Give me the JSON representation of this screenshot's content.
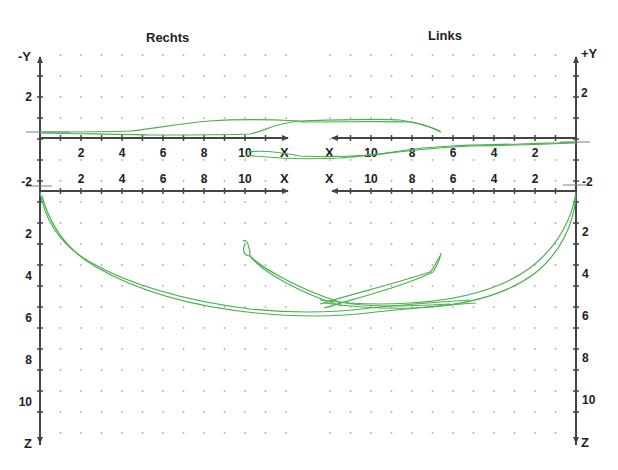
{
  "titles": {
    "left": "Rechts",
    "right": "Links"
  },
  "colors": {
    "trace": "#4caf50",
    "trace_dark": "#2e7d32",
    "axis": "#444444",
    "grid_dot": "#b0b0b0",
    "background": "#ffffff"
  },
  "axes": {
    "left_vertical_top": "-Y",
    "right_vertical_top": "+Y",
    "vertical_bottom": "Z",
    "x_label": "X"
  },
  "chart_data": {
    "type": "line",
    "panels": [
      {
        "name": "Rechts (top, X–Y plane)",
        "xlabel": "X",
        "ylabel": "-Y",
        "x_ticks": [
          2,
          4,
          6,
          8,
          10
        ],
        "y_ticks": [
          2,
          -2
        ],
        "xlim": [
          0,
          12
        ],
        "ylim": [
          -2,
          4
        ],
        "series": [
          {
            "name": "upper path",
            "x": [
              0,
              2,
              4,
              6,
              8,
              10,
              11.5
            ],
            "y": [
              0.1,
              0.1,
              0.15,
              0.6,
              0.9,
              0.95,
              0.9
            ]
          },
          {
            "name": "lower path",
            "x": [
              0,
              2,
              4,
              6,
              8,
              10,
              11.5
            ],
            "y": [
              0.1,
              0.05,
              0.0,
              -0.1,
              -0.1,
              0.0,
              0.8
            ]
          }
        ]
      },
      {
        "name": "Links (top, X–Y plane)",
        "xlabel": "X",
        "ylabel": "+Y",
        "x_ticks": [
          10,
          8,
          6,
          4,
          2
        ],
        "y_ticks": [
          2,
          -2
        ],
        "xlim": [
          12,
          0
        ],
        "ylim": [
          -2,
          4
        ],
        "series": [
          {
            "name": "upper path",
            "x": [
              12,
              10,
              8,
              6.5,
              5.5
            ],
            "y": [
              0.9,
              0.95,
              0.9,
              0.5,
              0.05
            ]
          },
          {
            "name": "lower path",
            "x": [
              12,
              10,
              8,
              6,
              4,
              2,
              0
            ],
            "y": [
              -0.7,
              -0.8,
              -0.6,
              -0.4,
              -0.4,
              -0.3,
              -0.1
            ]
          }
        ]
      },
      {
        "name": "Rechts (front, X–Z plane)",
        "xlabel": "X",
        "ylabel": "Z",
        "x_ticks": [
          2,
          4,
          6,
          8,
          10
        ],
        "z_ticks": [
          2,
          4,
          6,
          8,
          10
        ],
        "xlim": [
          0,
          12
        ],
        "zlim": [
          0,
          12
        ],
        "series": [
          {
            "name": "descent arc",
            "x": [
              0,
              1,
              2,
              4,
              6,
              8,
              10,
              12,
              14,
              16,
              18
            ],
            "z": [
              0,
              2.5,
              3.8,
              4.8,
              5.4,
              5.8,
              5.9,
              5.7,
              5.4,
              5.2,
              5.3
            ]
          },
          {
            "name": "return arc",
            "x": [
              10,
              10.2,
              11,
              13,
              15,
              17
            ],
            "z": [
              2.3,
              3.2,
              3.6,
              4.5,
              5.3,
              5.5
            ]
          }
        ]
      },
      {
        "name": "Links (front, X–Z plane)",
        "xlabel": "X",
        "ylabel": "Z",
        "x_ticks": [
          10,
          8,
          6,
          4,
          2
        ],
        "z_ticks": [
          2,
          4,
          6,
          8,
          10
        ],
        "xlim": [
          12,
          0
        ],
        "zlim": [
          0,
          12
        ],
        "series": [
          {
            "name": "descent arc",
            "x": [
              0,
              0.5,
              1.5,
              3,
              5,
              7,
              9,
              11
            ],
            "z": [
              0,
              2,
              3.4,
              4.5,
              5.1,
              5.3,
              5.4,
              5.5
            ]
          },
          {
            "name": "return arc",
            "x": [
              6.5,
              6.8,
              8,
              10,
              12
            ],
            "z": [
              3.1,
              3.6,
              4.3,
              4.9,
              5.3
            ]
          }
        ]
      }
    ],
    "grid": "dotted",
    "legend": "none"
  }
}
